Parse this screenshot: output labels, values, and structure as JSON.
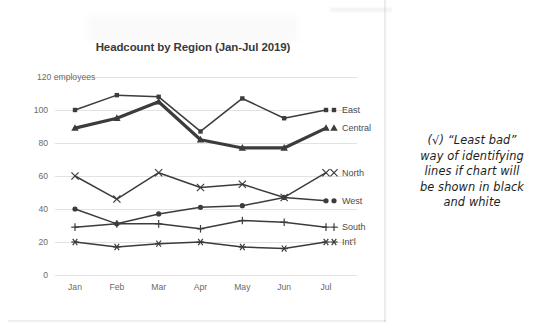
{
  "chart_data": {
    "type": "line",
    "title": "Headcount by Region (Jan-Jul 2019)",
    "xlabel": "",
    "ylabel": "",
    "y_axis_top_label": "120 employees",
    "ylim": [
      0,
      120
    ],
    "yticks": [
      0,
      20,
      40,
      60,
      80,
      100,
      120
    ],
    "ytick_labels": [
      "0",
      "20",
      "40",
      "60",
      "80",
      "100",
      "120 employees"
    ],
    "grid": true,
    "legend_position": "right-of-line-end",
    "categories": [
      "Jan",
      "Feb",
      "Mar",
      "Apr",
      "May",
      "Jun",
      "Jul"
    ],
    "series": [
      {
        "name": "East",
        "marker": "square",
        "emphasis": false,
        "values": [
          100,
          109,
          108,
          87,
          107,
          95,
          100
        ]
      },
      {
        "name": "Central",
        "marker": "triangle",
        "emphasis": true,
        "values": [
          89,
          95,
          105,
          82,
          77,
          77,
          89
        ]
      },
      {
        "name": "North",
        "marker": "x",
        "emphasis": false,
        "values": [
          60,
          46,
          62,
          53,
          55,
          47,
          62
        ]
      },
      {
        "name": "West",
        "marker": "circle",
        "emphasis": false,
        "values": [
          40,
          31,
          37,
          41,
          42,
          47,
          45
        ]
      },
      {
        "name": "South",
        "marker": "plus",
        "emphasis": false,
        "values": [
          29,
          31,
          31,
          28,
          33,
          32,
          29
        ]
      },
      {
        "name": "Int'l",
        "marker": "asterisk",
        "emphasis": false,
        "values": [
          20,
          17,
          19,
          20,
          17,
          16,
          20
        ]
      }
    ]
  },
  "annotation": {
    "lines": [
      "(√) “Least bad”",
      "way of identifying",
      "lines if chart will",
      "be shown in black",
      "and white"
    ]
  },
  "colors": {
    "line": "#3c3c3c",
    "gridline": "#e2e2e2",
    "axis_text": "#6a6a6a",
    "title_text": "#3a3a3a",
    "annotation_text": "#1d1d1d",
    "background": "#ffffff"
  }
}
